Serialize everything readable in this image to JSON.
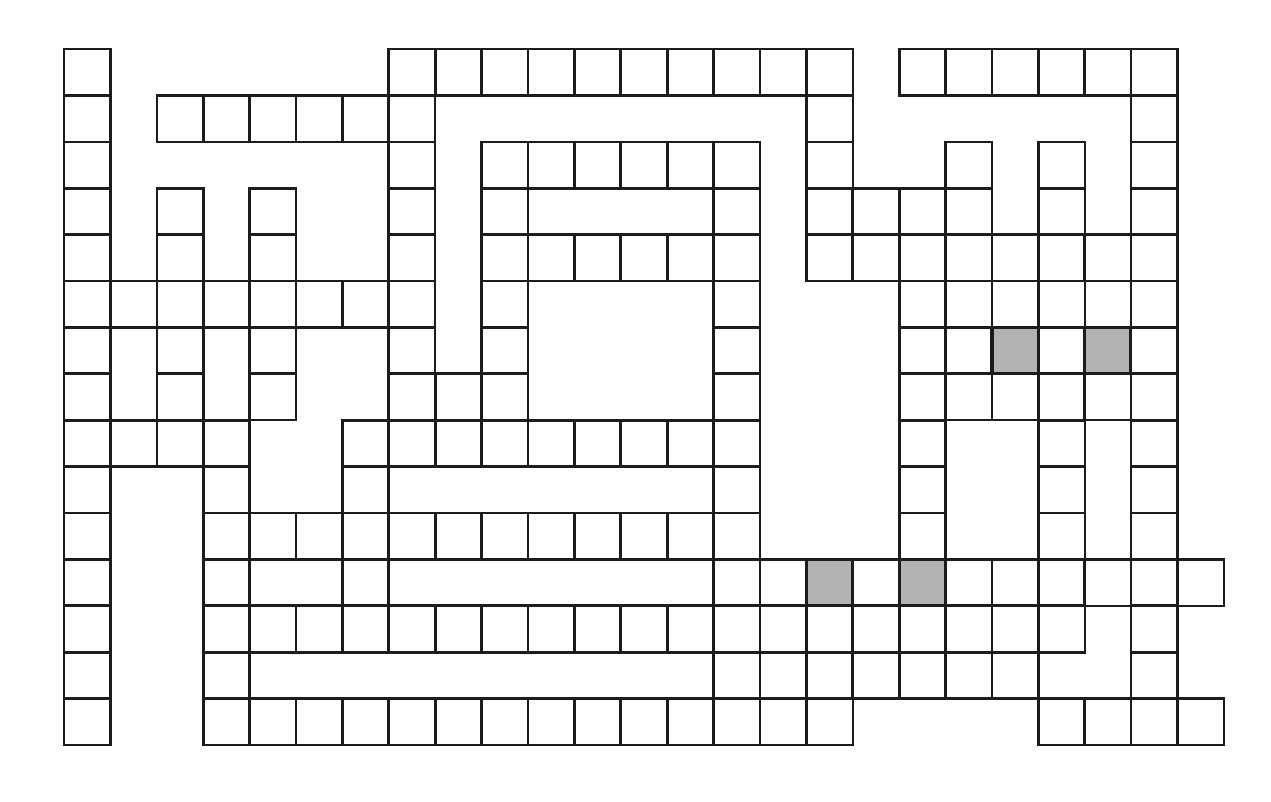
{
  "puzzle": {
    "kind": "crossword-grid",
    "title": "Crossword Puzzle Grid",
    "columns": 25,
    "rows": 15,
    "cell_size": 46.4,
    "origin_x": 62,
    "origin_y": 47,
    "cell_border_color": "#1c1c1c",
    "cell_fill_color": "#ffffff",
    "shaded_fill_color": "#b3b3b3",
    "background_color": "#ffffff",
    "shaded_cells": [
      {
        "row": 6,
        "col": 20
      },
      {
        "row": 6,
        "col": 22
      },
      {
        "row": 11,
        "col": 16
      },
      {
        "row": 11,
        "col": 18
      }
    ],
    "rows_cells": [
      [
        0,
        7,
        8,
        9,
        10,
        11,
        12,
        13,
        14,
        15,
        16,
        18,
        19,
        20,
        21,
        22,
        23
      ],
      [
        0,
        2,
        3,
        4,
        5,
        6,
        7,
        16,
        23
      ],
      [
        0,
        7,
        9,
        10,
        11,
        12,
        13,
        14,
        16,
        19,
        21,
        23
      ],
      [
        0,
        2,
        4,
        7,
        9,
        14,
        16,
        17,
        18,
        19,
        21,
        23
      ],
      [
        0,
        2,
        4,
        7,
        9,
        10,
        11,
        12,
        13,
        14,
        16,
        17,
        18,
        19,
        20,
        21,
        22,
        23
      ],
      [
        0,
        1,
        2,
        3,
        4,
        5,
        6,
        7,
        9,
        14,
        18,
        19,
        21,
        23
      ],
      [
        0,
        2,
        4,
        7,
        9,
        14,
        18,
        19,
        20,
        21,
        22,
        23
      ],
      [
        0,
        2,
        4,
        7,
        8,
        9,
        14,
        18,
        19,
        20,
        21,
        22,
        23
      ],
      [
        0,
        1,
        2,
        3,
        6,
        7,
        8,
        9,
        10,
        11,
        12,
        13,
        14,
        18,
        21,
        23
      ],
      [
        0,
        3,
        6,
        14,
        18,
        21,
        23
      ],
      [
        0,
        3,
        4,
        5,
        6,
        7,
        8,
        9,
        10,
        11,
        12,
        13,
        14,
        18,
        21,
        23
      ],
      [
        0,
        3,
        6,
        14,
        15,
        16,
        17,
        18,
        19,
        20,
        21,
        22,
        23,
        24
      ],
      [
        0,
        3,
        4,
        5,
        6,
        7,
        8,
        9,
        10,
        11,
        12,
        13,
        14,
        15,
        16,
        17,
        18,
        19,
        20,
        21,
        23
      ],
      [
        0,
        3,
        14,
        16,
        17,
        18,
        19,
        20,
        23
      ],
      [
        0,
        3,
        4,
        5,
        6,
        7,
        8,
        9,
        10,
        11,
        12,
        13,
        14,
        15,
        16,
        21,
        22,
        23,
        24
      ]
    ]
  }
}
